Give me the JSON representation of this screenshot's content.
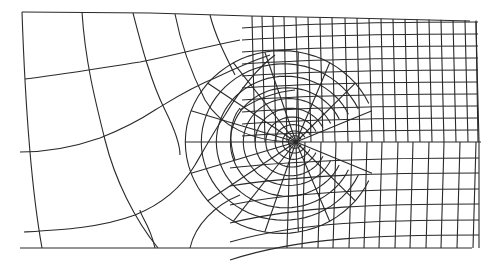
{
  "diagram": {
    "type": "finite-element-mesh",
    "stroke_color": "#2a2a2a",
    "background": "#ffffff",
    "crack_tip": [
      296,
      142
    ],
    "boundary": {
      "top_left": [
        22,
        12
      ],
      "top_right": [
        470,
        21
      ],
      "right_top": [
        480,
        22
      ],
      "right_mid": [
        480,
        142
      ],
      "right_bottom": [
        479,
        248
      ],
      "bottom_left": [
        20,
        248
      ],
      "bottom_right": [
        472,
        248
      ],
      "left_mid": [
        20,
        152
      ]
    },
    "crack_line": {
      "from": [
        296,
        142
      ],
      "to": [
        481,
        142
      ]
    },
    "regular_grid": {
      "upper_columns_x": [
        252,
        262,
        273,
        284,
        296,
        308,
        320,
        332,
        345,
        357,
        369,
        381,
        393,
        405,
        417,
        429,
        441,
        453,
        465,
        476
      ],
      "upper_rows_y": [
        22,
        34,
        46,
        58,
        70,
        82,
        94,
        106,
        118,
        130
      ],
      "lower_columns_x": [
        290,
        305,
        321,
        336,
        352,
        367,
        382,
        398,
        413,
        429,
        444,
        460,
        476
      ],
      "lower_rows_y": [
        158,
        173,
        189,
        204,
        220,
        235
      ]
    },
    "radial_rings": 10,
    "radial_spokes": 16
  }
}
